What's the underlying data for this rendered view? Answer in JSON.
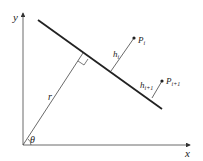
{
  "diagram": {
    "type": "geometry",
    "axes": {
      "x_label": "x",
      "y_label": "y"
    },
    "labels": {
      "r": "r",
      "theta": "θ",
      "h_i": "h",
      "h_i_sub": "i",
      "h_i1": "h",
      "h_i1_sub": "i+1",
      "p_i": "P",
      "p_i_sub": "i",
      "p_i1": "P",
      "p_i1_sub": "i+1"
    },
    "colors": {
      "stroke": "#222222",
      "background": "#ffffff"
    }
  }
}
